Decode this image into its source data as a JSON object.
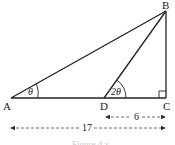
{
  "diagram": {
    "type": "right-triangle-geometry",
    "points": {
      "A": {
        "label": "A"
      },
      "B": {
        "label": "B"
      },
      "C": {
        "label": "C"
      },
      "D": {
        "label": "D"
      }
    },
    "angles": {
      "at_A": "θ",
      "at_D": "2θ",
      "at_C": "right-angle"
    },
    "dimensions": {
      "DC": "6",
      "AC": "17"
    },
    "caption": "Figure 4.x"
  },
  "colors": {
    "line": "#222222",
    "dash": "#444444",
    "background": "#ffffff"
  }
}
